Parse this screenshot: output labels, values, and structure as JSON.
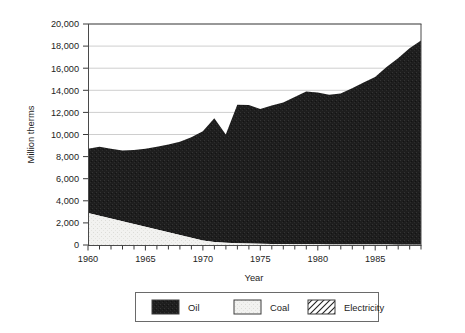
{
  "chart_data": {
    "type": "area",
    "stacked": true,
    "title": "",
    "subtitle": "",
    "xlabel": "Year",
    "ylabel": "Million therms",
    "xlim": [
      1960,
      1989
    ],
    "ylim": [
      0,
      20000
    ],
    "ytick_step": 2000,
    "grid": true,
    "legend_position": "bottom",
    "x_tick_labels": [
      "1960",
      "1965",
      "1970",
      "1975",
      "1980",
      "1985"
    ],
    "x_tick_values": [
      1960,
      1965,
      1970,
      1975,
      1980,
      1985
    ],
    "x_minor_tick_step": 1,
    "y_tick_labels": [
      "0",
      "2,000",
      "4,000",
      "6,000",
      "8,000",
      "10,000",
      "12,000",
      "14,000",
      "16,000",
      "18,000",
      "20,000"
    ],
    "y_tick_values": [
      0,
      2000,
      4000,
      6000,
      8000,
      10000,
      12000,
      14000,
      16000,
      18000,
      20000
    ],
    "x": [
      1960,
      1961,
      1962,
      1963,
      1964,
      1965,
      1966,
      1967,
      1968,
      1969,
      1970,
      1971,
      1972,
      1973,
      1974,
      1975,
      1976,
      1977,
      1978,
      1979,
      1980,
      1981,
      1982,
      1983,
      1984,
      1985,
      1986,
      1987,
      1988,
      1989
    ],
    "series": [
      {
        "name": "Coal",
        "color": "#f0f0ee",
        "pattern": "solid-light",
        "values": [
          2900,
          2650,
          2400,
          2150,
          1900,
          1650,
          1400,
          1150,
          900,
          650,
          400,
          280,
          200,
          160,
          130,
          110,
          95,
          85,
          75,
          70,
          60,
          55,
          50,
          45,
          40,
          38,
          35,
          32,
          30,
          28
        ]
      },
      {
        "name": "Oil",
        "color": "#202020",
        "pattern": "solid-dark",
        "values": [
          5800,
          6250,
          6300,
          6400,
          6700,
          7050,
          7500,
          7950,
          8450,
          9100,
          9900,
          11200,
          9800,
          12540,
          12550,
          12190,
          12520,
          12815,
          13325,
          13830,
          13740,
          13545,
          13650,
          14150,
          14660,
          15160,
          16065,
          16870,
          17770,
          18470
        ]
      },
      {
        "name": "Electricity",
        "color": "#ffffff",
        "pattern": "diagonal-hatch",
        "values": [
          0,
          0,
          0,
          0,
          0,
          0,
          0,
          0,
          0,
          0,
          0,
          0,
          0,
          0,
          0,
          0,
          0,
          0,
          0,
          0,
          0,
          0,
          0,
          0,
          0,
          0,
          0,
          0,
          0,
          0
        ]
      }
    ],
    "totals": [
      8700,
      8900,
      8700,
      8550,
      8600,
      8700,
      8900,
      9100,
      9350,
      9750,
      10300,
      11480,
      10000,
      12700,
      12680,
      12300,
      12615,
      12900,
      13400,
      13900,
      13800,
      13600,
      13700,
      14195,
      14700,
      15198,
      16100,
      16902,
      17800,
      18498
    ]
  },
  "legend": {
    "items": [
      {
        "label": "Oil",
        "swatch": "solid-dark"
      },
      {
        "label": "Coal",
        "swatch": "solid-light"
      },
      {
        "label": "Electricity",
        "swatch": "diagonal-hatch"
      }
    ]
  }
}
